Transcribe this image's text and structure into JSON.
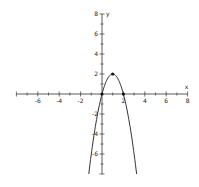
{
  "chart_data": {
    "type": "line",
    "title": "",
    "xlabel": "x",
    "ylabel": "y",
    "function": "y = -2(x-1)^2 + 2",
    "xlim": [
      -8,
      8
    ],
    "ylim": [
      -8,
      8
    ],
    "grid": false,
    "x_tick_labels": [
      "-6",
      "-4",
      "-2",
      "2",
      "4",
      "6",
      "8"
    ],
    "y_tick_labels": [
      "8",
      "6",
      "4",
      "2",
      "-2",
      "-4",
      "-6"
    ],
    "highlighted_points": [
      {
        "x": 0,
        "y": 0,
        "label": "x-intercept"
      },
      {
        "x": 1,
        "y": 2,
        "label": "vertex"
      },
      {
        "x": 2,
        "y": 0,
        "label": "x-intercept"
      }
    ],
    "series": [
      {
        "name": "parabola",
        "x": [
          -1.236,
          -1,
          -0.5,
          0,
          0.5,
          1,
          1.5,
          2,
          2.5,
          3,
          3.236
        ],
        "y": [
          -8,
          -6,
          -2.5,
          0,
          1.5,
          2,
          1.5,
          0,
          -2.5,
          -6,
          -8
        ]
      }
    ],
    "colors": {
      "axis": "#333333",
      "curve": "#333333",
      "points": "#111111"
    }
  }
}
